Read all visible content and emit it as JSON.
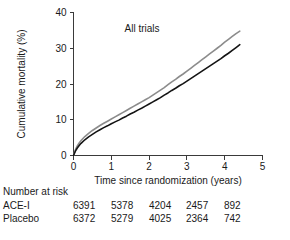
{
  "chart_data": {
    "type": "line",
    "title": "",
    "annotation": "All trials",
    "xlabel": "Time since randomization (years)",
    "ylabel": "Cumulative mortality (%)",
    "xlim": [
      0,
      5
    ],
    "ylim": [
      0,
      40
    ],
    "xticks": [
      0,
      1,
      2,
      3,
      4,
      5
    ],
    "xtick_labels": [
      "0",
      "1",
      "2",
      "3",
      "4",
      "5"
    ],
    "yticks": [
      0,
      10,
      20,
      30,
      40
    ],
    "ytick_labels": [
      "0",
      "10",
      "20",
      "30",
      "40"
    ],
    "grid": false,
    "legend_position": "none",
    "series": [
      {
        "name": "Placebo",
        "color": "#8c8c8c",
        "x": [
          0,
          0.05,
          0.1,
          0.15,
          0.2,
          0.3,
          0.4,
          0.5,
          0.6,
          0.7,
          0.8,
          0.9,
          1.0,
          1.1,
          1.2,
          1.3,
          1.4,
          1.5,
          1.6,
          1.7,
          1.8,
          1.9,
          2.0,
          2.1,
          2.2,
          2.3,
          2.4,
          2.5,
          2.6,
          2.7,
          2.8,
          2.9,
          3.0,
          3.1,
          3.2,
          3.3,
          3.4,
          3.5,
          3.6,
          3.7,
          3.8,
          3.9,
          4.0,
          4.1,
          4.2,
          4.3,
          4.4
        ],
        "y": [
          0,
          1.6,
          2.7,
          3.5,
          4.2,
          5.3,
          6.2,
          7.0,
          7.7,
          8.4,
          9.0,
          9.6,
          10.2,
          10.8,
          11.4,
          12.0,
          12.6,
          13.2,
          13.8,
          14.4,
          15.0,
          15.6,
          16.2,
          16.9,
          17.6,
          18.3,
          19.0,
          19.8,
          20.6,
          21.3,
          22.1,
          22.8,
          23.6,
          24.4,
          25.2,
          26.0,
          26.8,
          27.6,
          28.4,
          29.2,
          30.0,
          30.8,
          31.7,
          32.5,
          33.3,
          34.1,
          34.8
        ]
      },
      {
        "name": "ACE-I",
        "color": "#141414",
        "x": [
          0,
          0.05,
          0.1,
          0.15,
          0.2,
          0.3,
          0.4,
          0.5,
          0.6,
          0.7,
          0.8,
          0.9,
          1.0,
          1.1,
          1.2,
          1.3,
          1.4,
          1.5,
          1.6,
          1.7,
          1.8,
          1.9,
          2.0,
          2.1,
          2.2,
          2.3,
          2.4,
          2.5,
          2.6,
          2.7,
          2.8,
          2.9,
          3.0,
          3.1,
          3.2,
          3.3,
          3.4,
          3.5,
          3.6,
          3.7,
          3.8,
          3.9,
          4.0,
          4.1,
          4.2,
          4.3,
          4.4
        ],
        "y": [
          0,
          1.2,
          2.1,
          2.8,
          3.4,
          4.4,
          5.2,
          5.9,
          6.6,
          7.2,
          7.8,
          8.3,
          8.9,
          9.4,
          9.9,
          10.5,
          11.0,
          11.6,
          12.1,
          12.7,
          13.2,
          13.8,
          14.4,
          15.0,
          15.6,
          16.2,
          16.9,
          17.5,
          18.2,
          18.8,
          19.5,
          20.1,
          20.8,
          21.5,
          22.2,
          22.9,
          23.6,
          24.3,
          25.0,
          25.7,
          26.4,
          27.1,
          27.9,
          28.6,
          29.4,
          30.2,
          31.0
        ]
      }
    ]
  },
  "risk_table": {
    "title": "Number at risk",
    "rows": [
      {
        "label": "ACE-I",
        "values": [
          "6391",
          "5378",
          "4204",
          "2457",
          "892"
        ]
      },
      {
        "label": "Placebo",
        "values": [
          "6372",
          "5279",
          "4025",
          "2364",
          "742"
        ]
      }
    ]
  }
}
